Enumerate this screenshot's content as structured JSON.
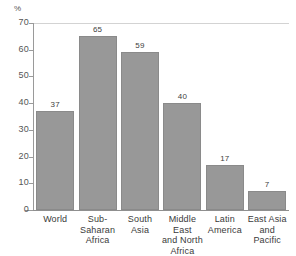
{
  "chart_data": {
    "type": "bar",
    "title": "",
    "xlabel": "",
    "ylabel": "%",
    "ylim": [
      0,
      70
    ],
    "yticks": [
      0,
      10,
      20,
      30,
      40,
      50,
      60,
      70
    ],
    "grid": "top-only",
    "legend": "none",
    "bar_color": "#989898",
    "categories": [
      "World",
      "Sub-Saharan Africa",
      "South Asia",
      "Middle East and North Africa",
      "Latin America",
      "East Asia and Pacific"
    ],
    "category_lines": [
      [
        "World"
      ],
      [
        "Sub-",
        "Saharan",
        "Africa"
      ],
      [
        "South",
        "Asia"
      ],
      [
        "Middle East",
        "and North",
        "Africa"
      ],
      [
        "Latin",
        "America"
      ],
      [
        "East Asia",
        "and Pacific"
      ]
    ],
    "values": [
      37,
      65,
      59,
      40,
      17,
      7
    ],
    "value_labels": [
      "37",
      "65",
      "59",
      "40",
      "17",
      "7"
    ]
  },
  "axis": {
    "unit_label": "%",
    "tick_labels": [
      "70",
      "60",
      "50",
      "40",
      "30",
      "20",
      "10",
      "0"
    ]
  }
}
